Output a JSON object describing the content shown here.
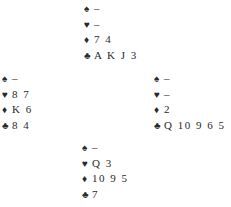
{
  "diagram": {
    "type": "bridge-deal",
    "suit_symbols": {
      "spades": "♠",
      "hearts": "♥",
      "diamonds": "♦",
      "clubs": "♣"
    },
    "hands": {
      "north": {
        "spades": "–",
        "hearts": "–",
        "diamonds": "7 4",
        "clubs": "A K J 3"
      },
      "west": {
        "spades": "–",
        "hearts": "8 7",
        "diamonds": "K 6",
        "clubs": "8 4"
      },
      "east": {
        "spades": "–",
        "hearts": "–",
        "diamonds": "2",
        "clubs": "Q 10 9 6 5"
      },
      "south": {
        "spades": "–",
        "hearts": "Q 3",
        "diamonds": "10 9 5",
        "clubs": "7"
      }
    }
  }
}
